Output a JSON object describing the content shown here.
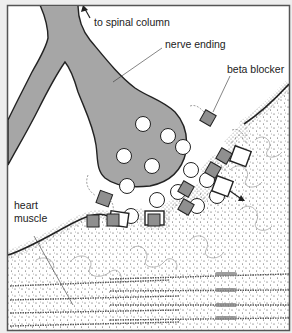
{
  "figure": {
    "type": "illustration",
    "colors": {
      "background": "#eeeeee",
      "panel": "#ffffff",
      "frame": "#555555",
      "outline": "#222222",
      "nerve_fill": "#a6a6a6",
      "blocker_fill": "#8f8f8f",
      "vesicle_fill": "#ffffff",
      "stipple": "#333333",
      "fiber": "#9a9a9a"
    }
  },
  "labels": {
    "spinal": "to spinal column",
    "nerve_ending": "nerve ending",
    "beta_blocker": "beta blocker",
    "heart_line1": "heart",
    "heart_line2": "muscle"
  },
  "icons": {
    "up_arrow": "arrow-up-left",
    "release_arrow": "arrow-down-right"
  }
}
